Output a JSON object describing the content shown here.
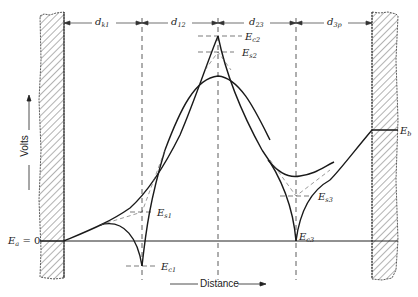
{
  "figure": {
    "type": "potential-distribution-diagram",
    "axes": {
      "x_label": "Distance",
      "y_label": "Volts"
    },
    "spacings": [
      {
        "id": "dk1",
        "main": "d",
        "sub": "k1"
      },
      {
        "id": "d12",
        "main": "d",
        "sub": "12"
      },
      {
        "id": "d23",
        "main": "d",
        "sub": "23"
      },
      {
        "id": "d3p",
        "main": "d",
        "sub": "3p"
      }
    ],
    "potentials": {
      "ea": {
        "main": "E",
        "sub": "a",
        "suffix": " = 0"
      },
      "eb": {
        "main": "E",
        "sub": "b"
      },
      "ec1": {
        "main": "E",
        "sub": "c1"
      },
      "es1": {
        "main": "E",
        "sub": "s1"
      },
      "ec2": {
        "main": "E",
        "sub": "c2"
      },
      "es2": {
        "main": "E",
        "sub": "s2"
      },
      "ec3": {
        "main": "E",
        "sub": "c3"
      },
      "es3": {
        "main": "E",
        "sub": "s3"
      }
    },
    "colors": {
      "ink": "#222222",
      "hatch": "#555555",
      "background": "#ffffff"
    }
  }
}
